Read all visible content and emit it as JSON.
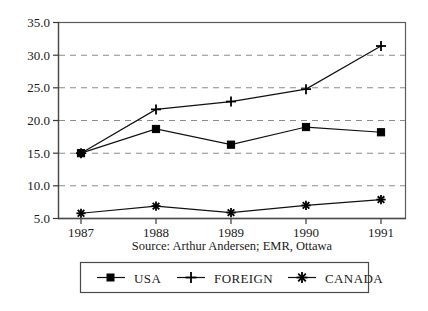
{
  "chart_data": {
    "type": "line",
    "title": "",
    "xlabel": "",
    "ylabel": "",
    "categories": [
      "1987",
      "1988",
      "1989",
      "1990",
      "1991"
    ],
    "x_tick_labels": [
      "1987",
      "1988",
      "1989",
      "1990",
      "1991"
    ],
    "y_tick_labels": [
      "35.0",
      "30.0",
      "25.0",
      "20.0",
      "15.0",
      "10.0",
      "5.0"
    ],
    "y_tick_values": [
      35.0,
      30.0,
      25.0,
      20.0,
      15.0,
      10.0,
      5.0
    ],
    "ylim": [
      5.0,
      35.0
    ],
    "grid": "horizontal-dashed",
    "legend_position": "bottom",
    "series": [
      {
        "name": "USA",
        "marker": "square",
        "values": [
          15.0,
          18.7,
          16.3,
          19.0,
          18.2
        ]
      },
      {
        "name": "FOREIGN",
        "marker": "plus",
        "values": [
          15.0,
          21.7,
          22.9,
          24.8,
          31.4
        ]
      },
      {
        "name": "CANADA",
        "marker": "asterisk",
        "values": [
          5.8,
          6.9,
          5.9,
          7.0,
          7.9
        ]
      }
    ],
    "annotations": {
      "source": "Source: Arthur Andersen; EMR, Ottawa"
    },
    "colors": {
      "line": "#111111",
      "marker": "#000000",
      "grid": "#8c8c8c",
      "frame": "#5a5a5a",
      "background": "#ffffff"
    }
  },
  "legend": {
    "entries": [
      {
        "label": "USA",
        "marker": "square-marker-icon"
      },
      {
        "label": "FOREIGN",
        "marker": "plus-marker-icon"
      },
      {
        "label": "CANADA",
        "marker": "asterisk-marker-icon"
      }
    ]
  },
  "axes": {
    "y_labels": [
      "35.0",
      "30.0",
      "25.0",
      "20.0",
      "15.0",
      "10.0",
      "5.0"
    ],
    "x_labels": [
      "1987",
      "1988",
      "1989",
      "1990",
      "1991"
    ]
  },
  "source_note": "Source: Arthur Andersen; EMR, Ottawa"
}
